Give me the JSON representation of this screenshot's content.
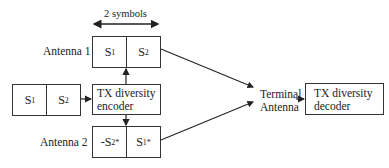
{
  "diagram": {
    "dimension_label": "2 symbols",
    "antenna1": {
      "label": "Antenna 1",
      "cells": [
        {
          "base": "S",
          "sub": "1",
          "sup": ""
        },
        {
          "base": "S",
          "sub": "2",
          "sup": ""
        }
      ]
    },
    "antenna2": {
      "label": "Antenna 2",
      "cells": [
        {
          "base": "-S",
          "sub": "2",
          "sup": "*"
        },
        {
          "base": "S",
          "sub": "1",
          "sup": "*"
        }
      ]
    },
    "input": {
      "cells": [
        {
          "base": "S",
          "sub": "1",
          "sup": ""
        },
        {
          "base": "S",
          "sub": "2",
          "sup": ""
        }
      ]
    },
    "encoder": {
      "line1": "TX diversity",
      "line2": "encoder"
    },
    "terminal": {
      "line1": "Terminal",
      "line2": "Antenna"
    },
    "decoder": {
      "line1": "TX diversity",
      "line2": "decoder"
    }
  }
}
